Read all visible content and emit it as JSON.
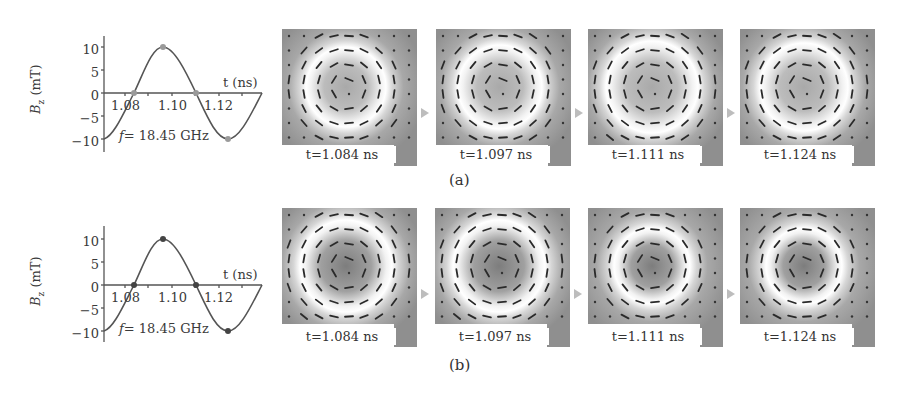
{
  "figure": {
    "rows": [
      {
        "caption": "(a)",
        "plot": {
          "ylabel": "B_z (mT)",
          "ylabel_main": "B",
          "ylabel_sub": "z",
          "ylabel_unit": " (mT)",
          "xlabel": "t (ns)",
          "annotation": "f = 18.45 GHz",
          "annotation_f": "f",
          "annotation_rest": "= 18.45 GHz",
          "yticks": [
            "10",
            "5",
            "0",
            "−5",
            "−10"
          ],
          "xticks": [
            "1.08",
            "1.10",
            "1.12"
          ]
        },
        "snapshots": [
          {
            "time": "t=1.084 ns"
          },
          {
            "time": "t=1.097 ns"
          },
          {
            "time": "t=1.111 ns"
          },
          {
            "time": "t=1.124 ns"
          }
        ]
      },
      {
        "caption": "(b)",
        "plot": {
          "ylabel": "B_z (mT)",
          "ylabel_main": "B",
          "ylabel_sub": "z",
          "ylabel_unit": " (mT)",
          "xlabel": "t (ns)",
          "annotation": "f = 18.45 GHz",
          "annotation_f": "f",
          "annotation_rest": "= 18.45 GHz",
          "yticks": [
            "10",
            "5",
            "0",
            "−5",
            "−10"
          ],
          "xticks": [
            "1.08",
            "1.10",
            "1.12"
          ]
        },
        "snapshots": [
          {
            "time": "t=1.084 ns"
          },
          {
            "time": "t=1.097 ns"
          },
          {
            "time": "t=1.111 ns"
          },
          {
            "time": "t=1.124 ns"
          }
        ]
      }
    ],
    "colors": {
      "curve": "#555555",
      "panel_dark": "#8c8c8c",
      "panel_ring": "#ffffff",
      "arrow_connector": "#bdbdbd"
    }
  },
  "chart_data": [
    {
      "type": "line",
      "title": "(a)",
      "xlabel": "t (ns)",
      "ylabel": "B_z (mT)",
      "xlim": [
        1.071,
        1.138
      ],
      "ylim": [
        -12,
        12
      ],
      "xticks": [
        1.08,
        1.1,
        1.12
      ],
      "yticks": [
        -10,
        -5,
        0,
        5,
        10
      ],
      "annotation": "f = 18.45 GHz",
      "series": [
        {
          "name": "B_z",
          "function": "sinusoid",
          "frequency_GHz": 18.45,
          "amplitude_mT": 10,
          "x": [
            1.071,
            1.084,
            1.097,
            1.111,
            1.124,
            1.138
          ],
          "y": [
            -10,
            0,
            10,
            0,
            -10,
            0
          ]
        }
      ],
      "markers": [
        {
          "t": 1.084,
          "B": 0
        },
        {
          "t": 1.097,
          "B": 10
        },
        {
          "t": 1.111,
          "B": 0
        },
        {
          "t": 1.124,
          "B": -10
        }
      ],
      "grid": false
    },
    {
      "type": "line",
      "title": "(b)",
      "xlabel": "t (ns)",
      "ylabel": "B_z (mT)",
      "xlim": [
        1.071,
        1.138
      ],
      "ylim": [
        -12,
        12
      ],
      "xticks": [
        1.08,
        1.1,
        1.12
      ],
      "yticks": [
        -10,
        -5,
        0,
        5,
        10
      ],
      "annotation": "f = 18.45 GHz",
      "series": [
        {
          "name": "B_z",
          "function": "sinusoid",
          "frequency_GHz": 18.45,
          "amplitude_mT": 10,
          "x": [
            1.071,
            1.084,
            1.097,
            1.111,
            1.124,
            1.138
          ],
          "y": [
            -10,
            0,
            10,
            0,
            -10,
            0
          ]
        }
      ],
      "markers": [
        {
          "t": 1.084,
          "B": 0
        },
        {
          "t": 1.097,
          "B": 10
        },
        {
          "t": 1.111,
          "B": 0
        },
        {
          "t": 1.124,
          "B": -10
        }
      ],
      "grid": false
    }
  ]
}
